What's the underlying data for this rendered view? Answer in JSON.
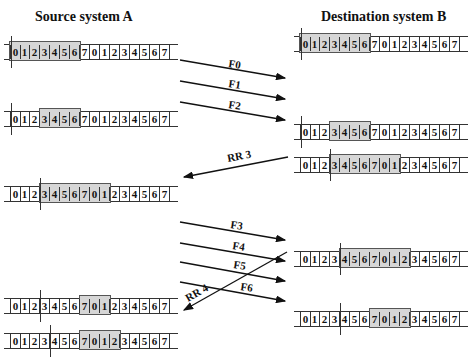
{
  "titles": {
    "source": "Source system A",
    "destination": "Destination system B"
  },
  "sequence": [
    "0",
    "1",
    "2",
    "3",
    "4",
    "5",
    "6",
    "7",
    "0",
    "1",
    "2",
    "3",
    "4",
    "5",
    "6",
    "7"
  ],
  "rows": [
    {
      "id": "src-1",
      "side": "source",
      "x": 10,
      "y": 44,
      "win_start": 0,
      "win_len": 7,
      "cut_after": 0
    },
    {
      "id": "src-2",
      "side": "source",
      "x": 10,
      "y": 111,
      "win_start": 3,
      "win_len": 4,
      "cut_after": 0
    },
    {
      "id": "src-3",
      "side": "source",
      "x": 10,
      "y": 186,
      "win_start": 3,
      "win_len": 7,
      "cut_after": 3
    },
    {
      "id": "src-4",
      "side": "source",
      "x": 10,
      "y": 298,
      "win_start": 7,
      "win_len": 3,
      "cut_after": 3
    },
    {
      "id": "src-5",
      "side": "source",
      "x": 10,
      "y": 333,
      "win_start": 7,
      "win_len": 4,
      "cut_after": 4
    },
    {
      "id": "dst-1",
      "side": "destination",
      "x": 300,
      "y": 36,
      "win_start": 0,
      "win_len": 7,
      "cut_after": 0
    },
    {
      "id": "dst-2",
      "side": "destination",
      "x": 300,
      "y": 124,
      "win_start": 3,
      "win_len": 4,
      "cut_after": 0
    },
    {
      "id": "dst-3",
      "side": "destination",
      "x": 300,
      "y": 157,
      "win_start": 3,
      "win_len": 7,
      "cut_after": 3
    },
    {
      "id": "dst-4",
      "side": "destination",
      "x": 300,
      "y": 251,
      "win_start": 4,
      "win_len": 7,
      "cut_after": 4
    },
    {
      "id": "dst-5",
      "side": "destination",
      "x": 300,
      "y": 311,
      "win_start": 7,
      "win_len": 4,
      "cut_after": 4
    }
  ],
  "messages": [
    {
      "label": "F0",
      "direction": "A-to-B"
    },
    {
      "label": "F1",
      "direction": "A-to-B"
    },
    {
      "label": "F2",
      "direction": "A-to-B"
    },
    {
      "label": "RR 3",
      "direction": "B-to-A"
    },
    {
      "label": "F3",
      "direction": "A-to-B"
    },
    {
      "label": "F4",
      "direction": "A-to-B"
    },
    {
      "label": "F5",
      "direction": "A-to-B"
    },
    {
      "label": "F6",
      "direction": "A-to-B"
    },
    {
      "label": "RR 4",
      "direction": "B-to-A"
    }
  ]
}
